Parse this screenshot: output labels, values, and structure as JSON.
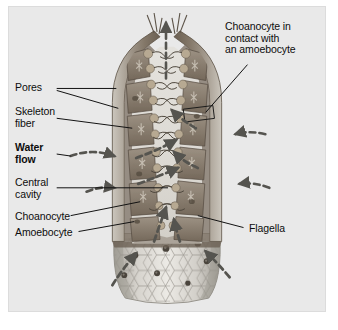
{
  "figure": {
    "kind": "biology-diagram",
    "panel_background": "#e9e9e9",
    "panel_border": "#dcdcdc",
    "ink_color": "#0d0d0d"
  },
  "labels": {
    "pores": "Pores",
    "skeleton_fiber": "Skeleton\nfiber",
    "water_flow": "Water\nflow",
    "central_cavity": "Central\ncavity",
    "choanocyte": "Choanocyte",
    "amoebocyte": "Amoebocyte",
    "flagella": "Flagella",
    "choanocyte_contact": "Choanocyte in\ncontact with\nan amoebocyte"
  },
  "anatomy": {
    "osculum_label": "osculum-opening",
    "body_wall_label": "body-wall",
    "central_cavity_label": "spongocoel",
    "pinacoderm_label": "hexagonal-pinacocyte-surface",
    "choanocyte_chambers": 10,
    "surface_pore_dots": 7,
    "highlight_box_label": "choanocyte-amoebocyte-contact-box"
  },
  "flow_arrows": {
    "osculum_outflow_label": "osculum-outflow-arrow",
    "inflow_count": 8,
    "style": "dashed",
    "color": "#55544f"
  },
  "colors": {
    "wall_outer": "#9a9187",
    "wall_mid": "#7f7264",
    "wall_inner": "#6d6256",
    "chamber": "#8d8274",
    "cavity": "#dedbd5",
    "surface": "#cfccc6",
    "surface_shade": "#b4b0a9",
    "pore_dot": "#4a443c",
    "arrow": "#55544f",
    "leader": "#111111"
  }
}
